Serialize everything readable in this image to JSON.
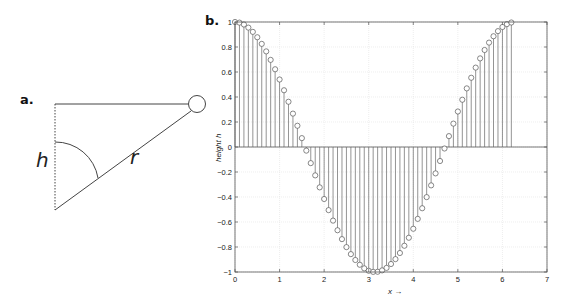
{
  "panel_a": {
    "label": "a.",
    "h_label": "h",
    "r_label": "r"
  },
  "panel_b": {
    "label": "b."
  },
  "chart_data": {
    "type": "stem",
    "title": "",
    "xlabel": "x →",
    "ylabel": "height h",
    "xlim": [
      0,
      7
    ],
    "ylim": [
      -1,
      1
    ],
    "grid": true,
    "x_ticks": [
      "0",
      "1",
      "2",
      "3",
      "4",
      "5",
      "6",
      "7"
    ],
    "y_ticks": [
      "1",
      "0.8",
      "0.6",
      "0.4",
      "0.2",
      "0",
      "−0.2",
      "−0.4",
      "−0.6",
      "−0.8",
      "−1"
    ],
    "marker": "circle",
    "function": "h = cos(x)",
    "x": [
      0,
      0.1,
      0.2,
      0.3,
      0.4,
      0.5,
      0.6,
      0.7,
      0.8,
      0.9,
      1.0,
      1.1,
      1.2,
      1.3,
      1.4,
      1.5,
      1.6,
      1.7,
      1.8,
      1.9,
      2.0,
      2.1,
      2.2,
      2.3,
      2.4,
      2.5,
      2.6,
      2.7,
      2.8,
      2.9,
      3.0,
      3.1,
      3.2,
      3.3,
      3.4,
      3.5,
      3.6,
      3.7,
      3.8,
      3.9,
      4.0,
      4.1,
      4.2,
      4.3,
      4.4,
      4.5,
      4.6,
      4.7,
      4.8,
      4.9,
      5.0,
      5.1,
      5.2,
      5.3,
      5.4,
      5.5,
      5.6,
      5.7,
      5.8,
      5.9,
      6.0,
      6.1,
      6.2
    ],
    "values": [
      1.0,
      0.995,
      0.98,
      0.955,
      0.921,
      0.878,
      0.825,
      0.765,
      0.697,
      0.622,
      0.54,
      0.454,
      0.362,
      0.267,
      0.17,
      0.071,
      -0.029,
      -0.129,
      -0.227,
      -0.323,
      -0.416,
      -0.505,
      -0.589,
      -0.666,
      -0.737,
      -0.801,
      -0.857,
      -0.904,
      -0.942,
      -0.971,
      -0.99,
      -0.999,
      -0.998,
      -0.987,
      -0.967,
      -0.936,
      -0.897,
      -0.848,
      -0.79,
      -0.726,
      -0.654,
      -0.575,
      -0.49,
      -0.401,
      -0.307,
      -0.211,
      -0.112,
      -0.012,
      0.087,
      0.187,
      0.284,
      0.378,
      0.469,
      0.554,
      0.635,
      0.709,
      0.776,
      0.835,
      0.886,
      0.927,
      0.96,
      0.983,
      0.996
    ]
  }
}
